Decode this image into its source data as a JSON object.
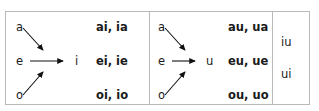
{
  "figure": {
    "colors": {
      "border": "#b9b9b9",
      "text": "#1a1a1a",
      "arrow": "#111111",
      "background": "#ffffff"
    }
  },
  "panels": [
    {
      "name": "i-panel",
      "target": "i",
      "sources": [
        "a",
        "e",
        "o"
      ],
      "pairs": [
        "ai, ia",
        "ei, ie",
        "oi, io"
      ],
      "arrows": [
        {
          "name": "arrow-a-to-i",
          "from": "a",
          "to": "i",
          "direction": "down-right"
        },
        {
          "name": "arrow-e-to-i",
          "from": "e",
          "to": "i",
          "direction": "right"
        },
        {
          "name": "arrow-o-to-i",
          "from": "o",
          "to": "i",
          "direction": "up-right"
        }
      ]
    },
    {
      "name": "u-panel",
      "target": "u",
      "sources": [
        "a",
        "e",
        "o"
      ],
      "pairs": [
        "au, ua",
        "eu, ue",
        "ou, uo"
      ],
      "arrows": [
        {
          "name": "arrow-a-to-u",
          "from": "a",
          "to": "u",
          "direction": "down-right"
        },
        {
          "name": "arrow-e-to-u",
          "from": "e",
          "to": "u",
          "direction": "right"
        },
        {
          "name": "arrow-o-to-u",
          "from": "o",
          "to": "u",
          "direction": "up-right"
        }
      ]
    }
  ],
  "extra_column": {
    "name": "iu-ui-column",
    "items": [
      "iu",
      "ui"
    ]
  }
}
